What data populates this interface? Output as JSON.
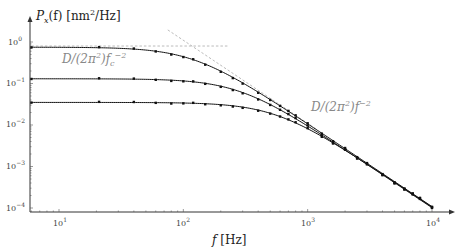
{
  "chart_data": {
    "type": "line",
    "title": "",
    "xlabel": "f [Hz]",
    "ylabel": "P_x(f) [nm²/Hz]",
    "xscale": "log",
    "yscale": "log",
    "xlim": [
      6,
      13000
    ],
    "ylim": [
      0.0001,
      1.5
    ],
    "x_ticks": [
      "10^1",
      "10^2",
      "10^3",
      "10^4"
    ],
    "y_ticks": [
      "10^0",
      "10^-1",
      "10^-2",
      "10^-3",
      "10^-4"
    ],
    "grid": false,
    "legend": null,
    "series": [
      {
        "name": "Lorentzian fc≈120 Hz",
        "plateau": 0.75,
        "fc": 120,
        "x": [
          6,
          21,
          40,
          60,
          80,
          100,
          120,
          150,
          200,
          250,
          300,
          400,
          500,
          600,
          700,
          800,
          1000,
          1300,
          1600,
          2000,
          2500,
          3000,
          4000,
          5000,
          6000,
          7000,
          8000,
          10000
        ],
        "markers": true
      },
      {
        "name": "Lorentzian fc≈280 Hz",
        "plateau": 0.13,
        "fc": 280,
        "x": [
          6,
          21,
          40,
          60,
          80,
          100,
          120,
          150,
          200,
          250,
          300,
          400,
          500,
          600,
          700,
          800,
          1000,
          1300,
          1600,
          2000,
          2500,
          3000,
          4000,
          5000,
          6000,
          7000,
          8000,
          10000
        ],
        "markers": true
      },
      {
        "name": "Lorentzian fc≈550 Hz",
        "plateau": 0.035,
        "fc": 550,
        "x": [
          6,
          21,
          40,
          60,
          80,
          100,
          120,
          150,
          200,
          250,
          300,
          400,
          500,
          600,
          700,
          800,
          1000,
          1300,
          1600,
          2000,
          2500,
          3000,
          4000,
          5000,
          6000,
          7000,
          8000,
          10000
        ],
        "markers": true
      }
    ],
    "asymptotes": [
      {
        "label": "D/(2π²)f_c⁻²",
        "kind": "horizontal",
        "y": 0.8,
        "x_range": [
          6,
          230
        ],
        "style": "dashed"
      },
      {
        "label": "D/(2π²)f⁻²",
        "kind": "power-law",
        "coef": 11000,
        "exponent": -2,
        "x_range": [
          75,
          1200
        ],
        "style": "dashed"
      }
    ],
    "annotations": [
      {
        "text": "D/(2π²)f_c⁻²",
        "near": "plateau of top curve"
      },
      {
        "text": "D/(2π²)f⁻²",
        "near": "high-frequency asymptote"
      }
    ]
  },
  "labels": {
    "ylabel_main": "P",
    "ylabel_sub": "x",
    "ylabel_rest": "(f) [nm",
    "ylabel_sup": "2",
    "ylabel_end": "/Hz]",
    "xlabel_f": "f",
    "xlabel_unit": " [Hz]",
    "annot_fc_a": "D/(2π",
    "annot_fc_sup2": "2",
    "annot_fc_b": ")f",
    "annot_fc_sub": "c",
    "annot_fc_sup": "−2",
    "annot_f_a": "D/(2π",
    "annot_f_sup2": "2",
    "annot_f_b": ")f",
    "annot_f_sup": "−2",
    "xt": [
      "10",
      "10",
      "10",
      "10"
    ],
    "xt_exp": [
      "1",
      "2",
      "3",
      "4"
    ],
    "yt": [
      "10",
      "10",
      "10",
      "10",
      "10"
    ],
    "yt_exp": [
      "0",
      "−1",
      "−2",
      "−3",
      "−4"
    ]
  }
}
